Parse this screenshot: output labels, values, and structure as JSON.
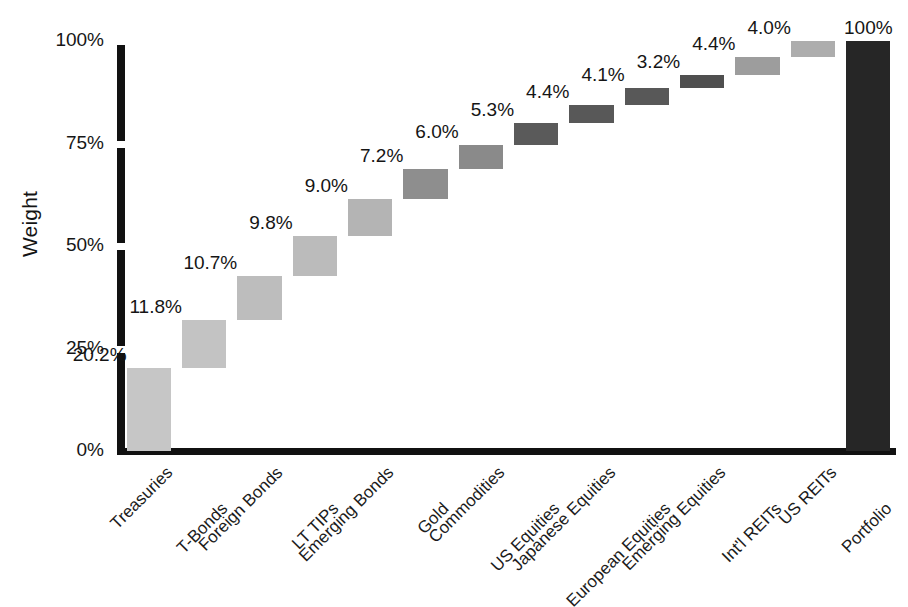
{
  "chart_data": {
    "type": "bar",
    "subtype": "waterfall",
    "title": "",
    "xlabel": "",
    "ylabel": "Weight",
    "ylim": [
      0,
      100
    ],
    "yticks": [
      0,
      25,
      50,
      75,
      100
    ],
    "ytick_labels": [
      "0%",
      "25%",
      "50%",
      "75%",
      "100%"
    ],
    "grid": false,
    "legend": false,
    "categories": [
      "Treasuries",
      "T-Bonds",
      "Foreign Bonds",
      "LT TIPs",
      "Emerging Bonds",
      "Gold",
      "Commodities",
      "US Equities",
      "Japanese Equities",
      "European Equities",
      "Emerging Equities",
      "Int'l REITs",
      "US REITs",
      "Portfolio"
    ],
    "values": [
      20.2,
      11.8,
      10.7,
      9.8,
      9.0,
      7.2,
      6.0,
      5.3,
      4.4,
      4.1,
      3.2,
      4.4,
      4.0,
      100
    ],
    "value_labels": [
      "20.2%",
      "11.8%",
      "10.7%",
      "9.8%",
      "9.0%",
      "7.2%",
      "6.0%",
      "5.3%",
      "4.4%",
      "4.1%",
      "3.2%",
      "4.4%",
      "4.0%",
      "100%"
    ],
    "cumulative_base": [
      0,
      20.2,
      32.0,
      42.7,
      52.5,
      61.5,
      68.7,
      74.7,
      80.0,
      84.4,
      88.5,
      91.7,
      96.1,
      0
    ],
    "cumulative_top": [
      20.2,
      32.0,
      42.7,
      52.5,
      61.5,
      68.7,
      74.7,
      80.0,
      84.4,
      88.5,
      91.7,
      96.1,
      100.1,
      100
    ],
    "bar_colors": [
      "#c6c6c6",
      "#c3c3c3",
      "#bdbdbd",
      "#bbbbbb",
      "#b4b4b4",
      "#8e8e8e",
      "#8a8a8a",
      "#5a5a5a",
      "#585858",
      "#585858",
      "#4f4f4f",
      "#9d9d9d",
      "#adadad",
      "#262626"
    ],
    "is_total": [
      false,
      false,
      false,
      false,
      false,
      false,
      false,
      false,
      false,
      false,
      false,
      false,
      false,
      true
    ],
    "axis_color": "#111111",
    "text_color": "#151515",
    "background": "#ffffff"
  }
}
